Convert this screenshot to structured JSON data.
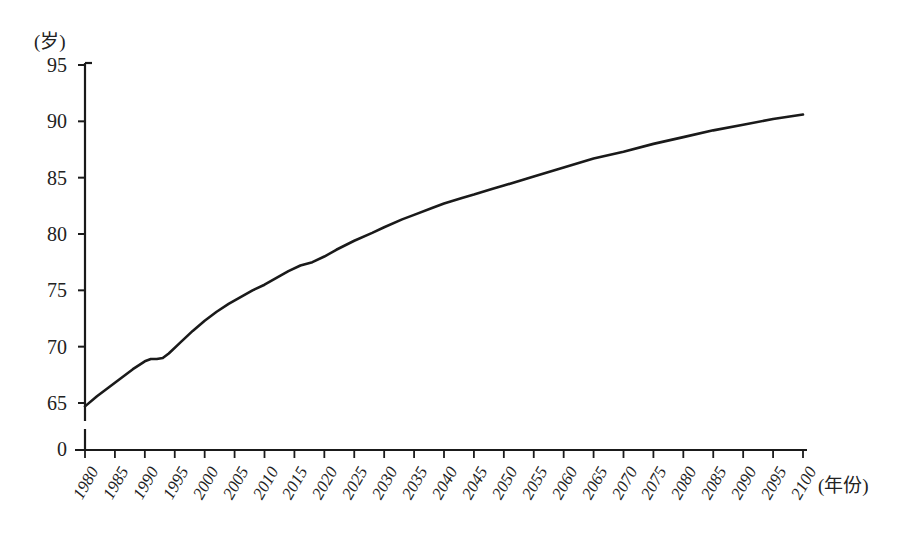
{
  "chart_data": {
    "type": "line",
    "title": "",
    "subtitle": "",
    "xlabel": "(年份)",
    "ylabel": "(岁)",
    "xlim": [
      1980,
      2100
    ],
    "ylim": [
      63.5,
      95
    ],
    "grid": false,
    "legend": null,
    "y_axis_broken_at_zero": true,
    "y_zero_label": "0",
    "y_ticks": [
      65,
      70,
      75,
      80,
      85,
      90,
      95
    ],
    "y_tick_labels": [
      "65",
      "70",
      "75",
      "80",
      "85",
      "90",
      "95"
    ],
    "x_ticks": [
      1980,
      1985,
      1990,
      1995,
      2000,
      2005,
      2010,
      2015,
      2020,
      2025,
      2030,
      2035,
      2040,
      2045,
      2050,
      2055,
      2060,
      2065,
      2070,
      2075,
      2080,
      2085,
      2090,
      2095,
      2100
    ],
    "x_tick_labels": [
      "1980",
      "1985",
      "1990",
      "1995",
      "2000",
      "2005",
      "2010",
      "2015",
      "2020",
      "2025",
      "2030",
      "2035",
      "2040",
      "2045",
      "2050",
      "2055",
      "2060",
      "2065",
      "2070",
      "2075",
      "2080",
      "2085",
      "2090",
      "2095",
      "2100"
    ],
    "series": [
      {
        "name": "预期寿命",
        "color": "#1a1a1a",
        "x": [
          1980,
          1982,
          1984,
          1986,
          1988,
          1990,
          1991,
          1992,
          1993,
          1994,
          1996,
          1998,
          2000,
          2002,
          2004,
          2006,
          2008,
          2010,
          2012,
          2014,
          2016,
          2018,
          2020,
          2022,
          2025,
          2028,
          2030,
          2033,
          2035,
          2038,
          2040,
          2043,
          2045,
          2048,
          2050,
          2055,
          2060,
          2065,
          2070,
          2075,
          2080,
          2085,
          2090,
          2095,
          2100
        ],
        "values": [
          64.7,
          65.6,
          66.4,
          67.2,
          68.0,
          68.7,
          68.9,
          68.9,
          69.0,
          69.4,
          70.4,
          71.4,
          72.3,
          73.1,
          73.8,
          74.4,
          75.0,
          75.5,
          76.1,
          76.7,
          77.2,
          77.5,
          78.0,
          78.6,
          79.4,
          80.1,
          80.6,
          81.3,
          81.7,
          82.3,
          82.7,
          83.2,
          83.5,
          84.0,
          84.3,
          85.1,
          85.9,
          86.7,
          87.3,
          88.0,
          88.6,
          89.2,
          89.7,
          90.2,
          90.6
        ]
      }
    ]
  },
  "axes": {
    "y_unit_label": "(岁)",
    "x_unit_label": "(年份)",
    "zero_label": "0"
  }
}
